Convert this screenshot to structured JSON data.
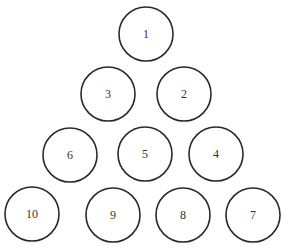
{
  "diagram": {
    "type": "triangular-arrangement",
    "stroke_color": "#2a2a2a",
    "background": "#ffffff",
    "circles": [
      {
        "label": "1",
        "cx": 146,
        "cy": 34,
        "r": 27
      },
      {
        "label": "3",
        "cx": 108,
        "cy": 94,
        "r": 27
      },
      {
        "label": "2",
        "cx": 184,
        "cy": 94,
        "r": 27
      },
      {
        "label": "6",
        "cx": 70,
        "cy": 155,
        "r": 27
      },
      {
        "label": "5",
        "cx": 145,
        "cy": 154,
        "r": 27
      },
      {
        "label": "4",
        "cx": 216,
        "cy": 154,
        "r": 27
      },
      {
        "label": "10",
        "cx": 32,
        "cy": 214,
        "r": 27
      },
      {
        "label": "9",
        "cx": 113,
        "cy": 215,
        "r": 27
      },
      {
        "label": "8",
        "cx": 183,
        "cy": 215,
        "r": 27
      },
      {
        "label": "7",
        "cx": 253,
        "cy": 215,
        "r": 27
      }
    ]
  }
}
